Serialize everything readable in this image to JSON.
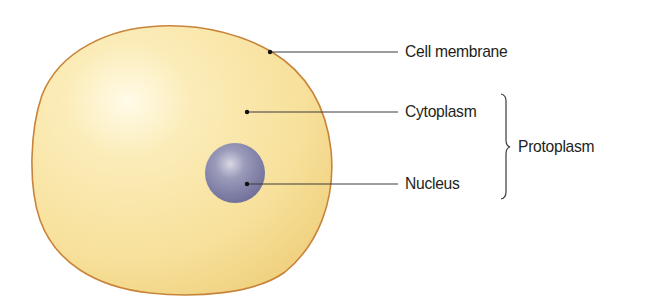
{
  "figure": {
    "colors": {
      "cytoplasm": "#f8e3a0",
      "membrane": "#c8843a",
      "nucleus": "#7f7fa6",
      "leader_line": "#3a3a3a",
      "text": "#231f20"
    },
    "labels": {
      "cell_membrane": "Cell membrane",
      "cytoplasm": "Cytoplasm",
      "nucleus": "Nucleus",
      "protoplasm": "Protoplasm"
    }
  }
}
